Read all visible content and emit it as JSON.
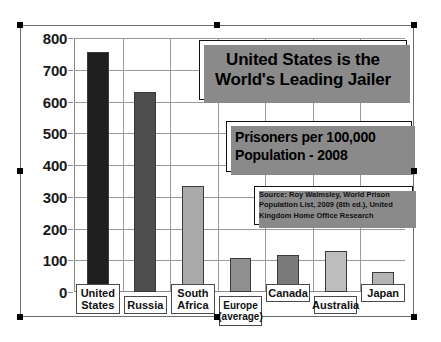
{
  "chart_data": {
    "type": "bar",
    "title": "United States is the World's Leading Jailer",
    "title_lines": [
      "United States is the",
      "World's Leading Jailer"
    ],
    "subtitle": "Prisoners per 100,000 Population - 2008",
    "subtitle_lines": [
      "Prisoners per 100,000",
      "Population - 2008"
    ],
    "source": "Source: Roy Walmsley, World Prison Population List, 2009 (8th ed.), United Kingdom Home Office Research",
    "source_lines": [
      "Source: Roy Walmsley, World Prison",
      "Population List, 2009 (8th ed.), United",
      "Kingdom Home Office Research"
    ],
    "xlabel": "",
    "ylabel": "",
    "ylim": [
      0,
      800
    ],
    "ytick_labels": [
      "800",
      "700",
      "600",
      "500",
      "400",
      "300",
      "200",
      "100",
      "0"
    ],
    "ytick_values": [
      800,
      700,
      600,
      500,
      400,
      300,
      200,
      100,
      0
    ],
    "grid": true,
    "legend": "none",
    "categories": [
      "United States",
      "Russia",
      "South Africa",
      "Europe (average)",
      "Canada",
      "Australia",
      "Japan"
    ],
    "category_lines": [
      [
        "United",
        "States"
      ],
      [
        "Russia",
        ""
      ],
      [
        "South",
        "Africa"
      ],
      [
        "Europe",
        "(average)"
      ],
      [
        "Canada",
        ""
      ],
      [
        "Australia",
        ""
      ],
      [
        "Japan",
        ""
      ]
    ],
    "values": [
      756,
      629,
      335,
      108,
      117,
      129,
      63
    ],
    "bar_colors": [
      "#1f1f1f",
      "#4d4d4d",
      "#aaaaaa",
      "#909090",
      "#7a7a7a",
      "#bdbdbd",
      "#b5b5b5"
    ]
  },
  "selection": {
    "handle_count": 8,
    "handle_color": "#000000"
  }
}
